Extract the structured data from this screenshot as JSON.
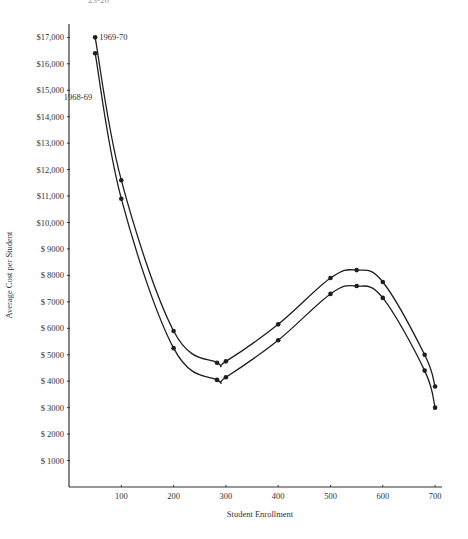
{
  "header_fragment": "23-20",
  "chart_data": {
    "type": "line",
    "title": "",
    "xlabel": "Student Enrollment",
    "ylabel": "Average Cost per Student",
    "xlim": [
      0,
      720
    ],
    "ylim": [
      0,
      17500
    ],
    "grid": false,
    "legend": "inline labels near first points",
    "x_ticks": [
      100,
      200,
      300,
      400,
      500,
      600,
      700
    ],
    "x_tick_labels": [
      "100",
      "200",
      "300",
      "400",
      "500",
      "600",
      "700"
    ],
    "y_ticks": [
      1000,
      2000,
      3000,
      4000,
      5000,
      6000,
      7000,
      8000,
      9000,
      10000,
      11000,
      12000,
      13000,
      14000,
      15000,
      16000,
      17000
    ],
    "y_tick_labels": [
      "$ 1000",
      "$ 2000",
      "$ 3000",
      "$ 4000",
      "$ 5000",
      "$ 6000",
      "$ 7000",
      "$ 8000",
      "$ 9000",
      "$10,000",
      "$11,000",
      "$12,000",
      "$13,000",
      "$14,000",
      "$15,000",
      "$16,000",
      "$17,000"
    ],
    "series": [
      {
        "name": "1969-70",
        "x": [
          50,
          100,
          200,
          283,
          300,
          400,
          500,
          550,
          600,
          680,
          700
        ],
        "values": [
          17000,
          11600,
          5900,
          4700,
          4750,
          6150,
          7900,
          8200,
          7750,
          5000,
          3800
        ]
      },
      {
        "name": "1968-69",
        "x": [
          50,
          100,
          200,
          283,
          300,
          400,
          500,
          550,
          600,
          680,
          700
        ],
        "values": [
          16400,
          10900,
          5250,
          4050,
          4150,
          5550,
          7300,
          7600,
          7150,
          4400,
          3000
        ]
      }
    ]
  },
  "colors": {
    "line": "#1e1e1e",
    "axis": "#333333",
    "text": "#333333"
  }
}
